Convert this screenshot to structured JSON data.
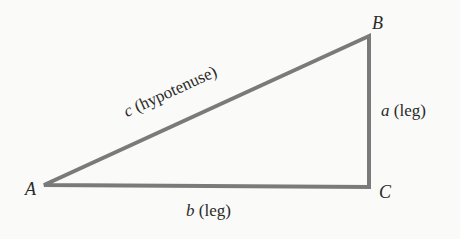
{
  "diagram": {
    "stroke_color": "#7a7a7a",
    "background": "#fafaf8",
    "vertices": {
      "A": {
        "label": "A",
        "x": 44,
        "y": 185
      },
      "B": {
        "label": "B",
        "x": 369,
        "y": 36
      },
      "C": {
        "label": "C",
        "x": 369,
        "y": 187
      }
    },
    "sides": {
      "a": {
        "var": "a",
        "desc": "(leg)"
      },
      "b": {
        "var": "b",
        "desc": "(leg)"
      },
      "c": {
        "var": "c",
        "desc": "(hypotenuse)"
      }
    }
  }
}
